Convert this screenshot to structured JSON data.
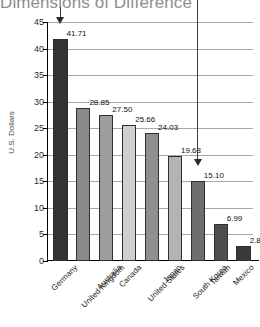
{
  "chart_data": {
    "type": "bar",
    "title": "Dimensions of Difference",
    "xlabel": "",
    "ylabel": "U.S. Dollars",
    "ylim": [
      0,
      45
    ],
    "ytick_step": 5,
    "yticks": [
      45,
      40,
      35,
      30,
      25,
      20,
      15,
      10,
      5,
      0
    ],
    "grid": true,
    "legend": "none",
    "categories": [
      "Germany",
      "United Kingdom",
      "Australia",
      "Canada",
      "United States",
      "Japan",
      "South Korea",
      "Taiwan",
      "Mexico"
    ],
    "values": [
      41.71,
      28.85,
      27.5,
      25.66,
      24.03,
      19.68,
      15.1,
      6.99,
      2.88
    ],
    "value_labels": [
      "41.71",
      "28.85",
      "27.50",
      "25.66",
      "24.03",
      "19.68",
      "15.10",
      "6.99",
      "2.88"
    ],
    "bar_colors": [
      "#343434",
      "#8a8a8a",
      "#9d9d9d",
      "#cfcfcf",
      "#8f8f8f",
      "#b3b3b3",
      "#6e6e6e",
      "#4e4e4e",
      "#3a3a3a"
    ],
    "annotations": [
      {
        "name": "arrow-germany",
        "target_category": "Germany",
        "type": "down-arrow"
      },
      {
        "name": "arrow-south-korea",
        "target_category": "South Korea",
        "type": "down-arrow-with-line"
      }
    ]
  }
}
